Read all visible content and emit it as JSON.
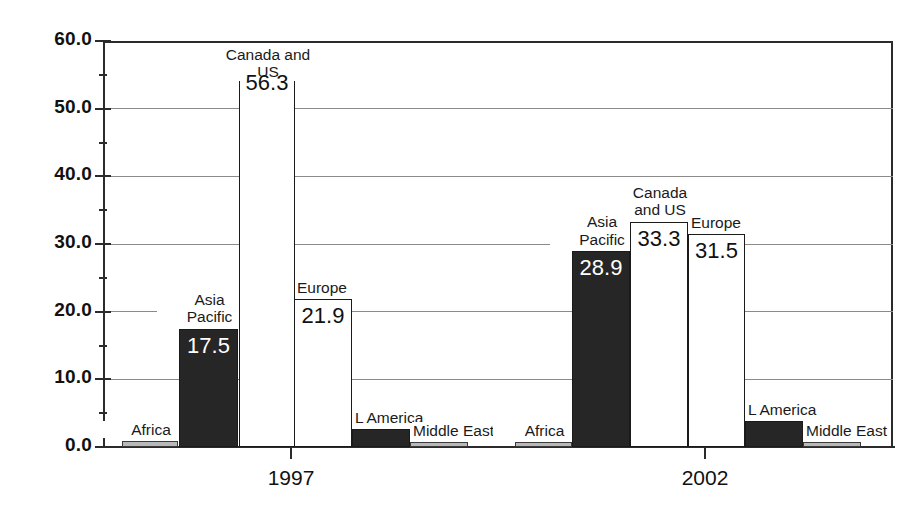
{
  "chart_data": {
    "type": "bar",
    "title": "",
    "subtitle": "",
    "xlabel": "",
    "ylabel": "",
    "categories": [
      "1997",
      "2002"
    ],
    "ylim": [
      0.0,
      60.0
    ],
    "ytick_labels": [
      "0.0",
      "10.0",
      "20.0",
      "30.0",
      "40.0",
      "50.0",
      "60.0"
    ],
    "ytick_values": [
      0.0,
      10.0,
      20.0,
      30.0,
      40.0,
      50.0,
      60.0
    ],
    "grid": true,
    "legend": "none",
    "series": [
      {
        "name": "Africa",
        "values": [
          0.9,
          0.7
        ],
        "fill": "gray"
      },
      {
        "name": "Asia\nPacific",
        "values": [
          17.5,
          28.9
        ],
        "fill": "black"
      },
      {
        "name": "Canada and US",
        "values": [
          56.3,
          33.3
        ],
        "fill": "white"
      },
      {
        "name": "Europe",
        "values": [
          21.9,
          31.5
        ],
        "fill": "white"
      },
      {
        "name": "L America",
        "values": [
          2.6,
          3.9
        ],
        "fill": "black"
      },
      {
        "name": "Middle East",
        "values": [
          0.8,
          0.8
        ],
        "fill": "gray"
      }
    ],
    "bars": [
      {
        "group": "1997",
        "name": "Africa",
        "label": "Africa",
        "value": 0.9,
        "value_label": "",
        "fill": "gray",
        "x": 122,
        "w": 56,
        "label_align": "center",
        "label_dx": 0,
        "label_dy": -20
      },
      {
        "group": "1997",
        "name": "Asia Pacific",
        "label": "Asia\nPacific",
        "value": 17.5,
        "value_label": "17.5",
        "fill": "black",
        "x": 179,
        "w": 59,
        "label_align": "center",
        "label_dx": 0,
        "label_dy": -38
      },
      {
        "group": "1997",
        "name": "Canada and US",
        "label": "Canada and US",
        "value": 56.3,
        "value_label": "56.3",
        "fill": "white",
        "x": 239,
        "w": 56,
        "label_align": "center",
        "label_dx": 0,
        "label_dy": -20
      },
      {
        "group": "1997",
        "name": "Europe",
        "label": "Europe",
        "value": 21.9,
        "value_label": "21.9",
        "fill": "white",
        "x": 294,
        "w": 58,
        "label_align": "left",
        "label_dx": 2,
        "label_dy": -20
      },
      {
        "group": "1997",
        "name": "L America",
        "label": "L America",
        "value": 2.6,
        "value_label": "",
        "fill": "black",
        "x": 352,
        "w": 58,
        "label_align": "left",
        "label_dx": 2,
        "label_dy": -20
      },
      {
        "group": "1997",
        "name": "Middle East",
        "label": "Middle East",
        "value": 0.8,
        "value_label": "",
        "fill": "gray",
        "x": 410,
        "w": 58,
        "label_align": "left",
        "label_dx": 2,
        "label_dy": -20
      },
      {
        "group": "2002",
        "name": "Africa",
        "label": "Africa",
        "value": 0.7,
        "value_label": "",
        "fill": "gray",
        "x": 515,
        "w": 57,
        "label_align": "center",
        "label_dx": 0,
        "label_dy": -20
      },
      {
        "group": "2002",
        "name": "Asia Pacific",
        "label": "Asia\nPacific",
        "value": 28.9,
        "value_label": "28.9",
        "fill": "black",
        "x": 572,
        "w": 58,
        "label_align": "center",
        "label_dx": 0,
        "label_dy": -38
      },
      {
        "group": "2002",
        "name": "Canada and US",
        "label": "Canada\nand US",
        "value": 33.3,
        "value_label": "33.3",
        "fill": "white",
        "x": 630,
        "w": 58,
        "label_align": "center",
        "label_dx": 0,
        "label_dy": -38
      },
      {
        "group": "2002",
        "name": "Europe",
        "label": "Europe",
        "value": 31.5,
        "value_label": "31.5",
        "fill": "white",
        "x": 688,
        "w": 57,
        "label_align": "left",
        "label_dx": 2,
        "label_dy": -20
      },
      {
        "group": "2002",
        "name": "L America",
        "label": "L America",
        "value": 3.9,
        "value_label": "",
        "fill": "black",
        "x": 745,
        "w": 58,
        "label_align": "left",
        "label_dx": 2,
        "label_dy": -20
      },
      {
        "group": "2002",
        "name": "Middle East",
        "label": "Middle East",
        "value": 0.8,
        "value_label": "",
        "fill": "gray",
        "x": 803,
        "w": 58,
        "label_align": "left",
        "label_dx": 2,
        "label_dy": -20
      }
    ],
    "colors": {
      "bar_black": "#262626",
      "bar_white": "#ffffff",
      "bar_gray": "#b8b8b8",
      "axis": "#2b2b2b",
      "grid": "#8a8a8a",
      "text": "#111111"
    },
    "geometry": {
      "plot_left": 103,
      "plot_right": 893,
      "plot_top": 41,
      "baseline_y": 447,
      "group_tick_x": [
        291,
        705
      ]
    }
  }
}
